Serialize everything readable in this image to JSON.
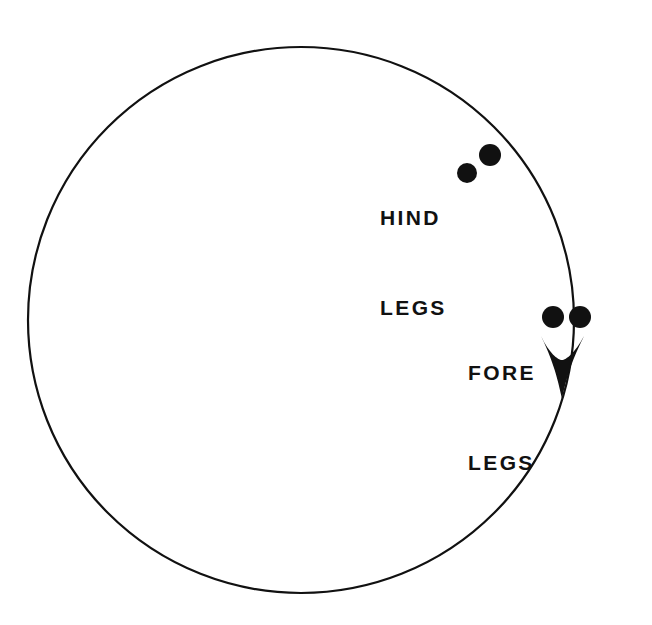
{
  "figure": {
    "background_color": "#ffffff",
    "ink_color": "#111111",
    "stroke_width": 2.2
  },
  "path": {
    "name": "circular-track",
    "shape": "ellipse",
    "center_x": 301,
    "center_y": 320,
    "radius_x": 273,
    "radius_y": 273,
    "direction": "clockwise"
  },
  "arrow": {
    "name": "direction-arrowhead",
    "description": "solid black arrowhead pointing downward along the track",
    "tip_x": 562,
    "tip_y": 400,
    "left_x": 541,
    "left_y": 337,
    "right_x": 584,
    "right_y": 337,
    "notch_x": 562,
    "notch_y": 360
  },
  "labels": [
    {
      "id": "hind-legs",
      "line1": "HIND",
      "line2": "LEGS",
      "x": 380,
      "y": 143
    },
    {
      "id": "fore-legs",
      "line1": "FORE",
      "line2": "LEGS",
      "x": 468,
      "y": 298
    }
  ],
  "markers": {
    "hind_legs": [
      {
        "id": "hind-leg-inner",
        "cx": 467,
        "cy": 173,
        "r": 10
      },
      {
        "id": "hind-leg-outer",
        "cx": 490,
        "cy": 155,
        "r": 11
      }
    ],
    "fore_legs": [
      {
        "id": "fore-leg-inner",
        "cx": 553,
        "cy": 317,
        "r": 11
      },
      {
        "id": "fore-leg-outer",
        "cx": 580,
        "cy": 317,
        "r": 11
      }
    ]
  },
  "chart_data": {
    "type": "scatter",
    "xlabel": "",
    "ylabel": "",
    "xlim": [
      0,
      652
    ],
    "ylim": [
      625,
      0
    ],
    "grid": false,
    "legend": "none",
    "annotations": [
      "HIND LEGS",
      "FORE LEGS"
    ],
    "series": [
      {
        "name": "HIND LEGS",
        "x": [
          467,
          490
        ],
        "y": [
          173,
          155
        ]
      },
      {
        "name": "FORE LEGS",
        "x": [
          553,
          580
        ],
        "y": [
          317,
          317
        ]
      }
    ],
    "reference_shapes": [
      {
        "name": "circular-track",
        "type": "ellipse",
        "cx": 301,
        "cy": 320,
        "rx": 273,
        "ry": 273
      },
      {
        "name": "direction-arrowhead",
        "type": "arrowhead",
        "x": 562,
        "y": 400
      }
    ]
  }
}
